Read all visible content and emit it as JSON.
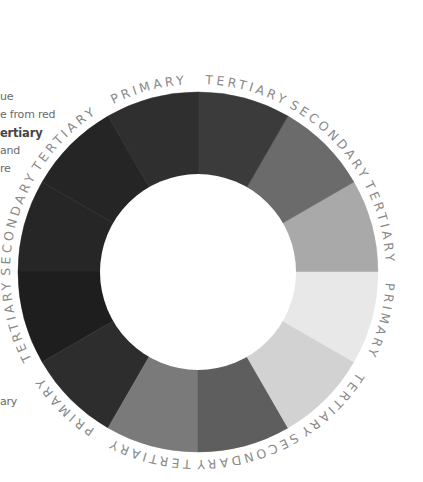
{
  "sidebar_text": {
    "fragments": [
      {
        "text": "ue",
        "y": 99,
        "bold": false
      },
      {
        "text": "e from red",
        "y": 117,
        "bold": false
      },
      {
        "text": "ertiary",
        "y": 135,
        "bold": true
      },
      {
        "text": "and",
        "y": 153,
        "bold": false
      },
      {
        "text": "re",
        "y": 171,
        "bold": false
      },
      {
        "text": "ary",
        "y": 404,
        "bold": false
      }
    ]
  },
  "wheel": {
    "center": [
      198,
      272
    ],
    "outer_radius": 180,
    "inner_radius": 98,
    "label_radius": 188,
    "segments": [
      {
        "start": 0,
        "end": 30,
        "type": "tertiary",
        "color": "#a9a9a9"
      },
      {
        "start": 30,
        "end": 60,
        "type": "secondary",
        "color": "#6b6b6b"
      },
      {
        "start": 60,
        "end": 90,
        "type": "tertiary",
        "color": "#3b3b3b"
      },
      {
        "start": 90,
        "end": 120,
        "type": "primary",
        "color": "#2f2f2f"
      },
      {
        "start": 120,
        "end": 150,
        "type": "tertiary",
        "color": "#252525"
      },
      {
        "start": 150,
        "end": 180,
        "type": "secondary",
        "color": "#262626"
      },
      {
        "start": 180,
        "end": 210,
        "type": "tertiary",
        "color": "#1e1e1e"
      },
      {
        "start": 210,
        "end": 240,
        "type": "primary",
        "color": "#2d2d2d"
      },
      {
        "start": 240,
        "end": 270,
        "type": "tertiary",
        "color": "#7a7a7a"
      },
      {
        "start": 270,
        "end": 300,
        "type": "secondary",
        "color": "#5e5e5e"
      },
      {
        "start": 300,
        "end": 330,
        "type": "tertiary",
        "color": "#d2d2d2"
      },
      {
        "start": 330,
        "end": 360,
        "type": "primary",
        "color": "#e8e8e8"
      }
    ],
    "ring_text": "PRIMARY TERTIARY SECONDARY TERTIARY PRIMARY TERTIARY SECONDARY TERTIARY PRIMARY TERTIARY SECONDARY TERTIARY",
    "labels": [
      {
        "text": "PRIMARY",
        "angle": 105
      },
      {
        "text": "TERTIARY",
        "angle": 75
      },
      {
        "text": "SECONDARY",
        "angle": 45
      },
      {
        "text": "TERTIARY",
        "angle": 15
      },
      {
        "text": "PRIMARY",
        "angle": -15
      },
      {
        "text": "TERTIARY",
        "angle": -45
      },
      {
        "text": "SECONDARY",
        "angle": -75
      },
      {
        "text": "TERTIARY",
        "angle": -105
      },
      {
        "text": "PRIMARY",
        "angle": -135
      },
      {
        "text": "TERTIARY",
        "angle": -165
      },
      {
        "text": "SECONDARY",
        "angle": 165
      },
      {
        "text": "TERTIARY",
        "angle": 135
      }
    ]
  }
}
